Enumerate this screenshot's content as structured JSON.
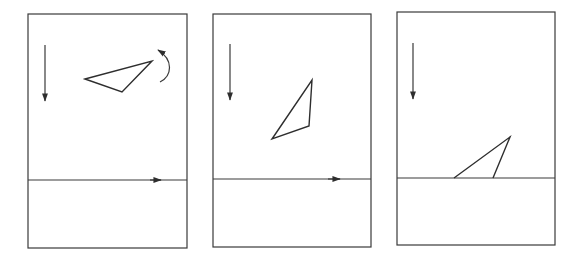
{
  "figure": {
    "colors": {
      "stroke": "#3a3a3a",
      "background": "#ffffff"
    },
    "panels": [
      {
        "id": "panel-1",
        "frame": {
          "x": 28,
          "y": 14,
          "w": 159,
          "h": 234
        },
        "surface_y": 180,
        "gravity_arrow": {
          "x": 45,
          "y1": 45,
          "y2": 100
        },
        "surface_arrow_tip_x": 160,
        "triangle": [
          [
            85,
            79
          ],
          [
            152,
            61
          ],
          [
            122,
            92
          ]
        ],
        "rotation_arrow": true,
        "icons": [
          "gravity-arrow-icon",
          "rotation-arrow-icon",
          "surface-velocity-arrow-icon"
        ]
      },
      {
        "id": "panel-2",
        "frame": {
          "x": 213,
          "y": 14,
          "w": 158,
          "h": 233
        },
        "surface_y": 179,
        "gravity_arrow": {
          "x": 230,
          "y1": 44,
          "y2": 99
        },
        "surface_arrow_tip_x": 340,
        "triangle": [
          [
            312,
            80
          ],
          [
            309,
            126
          ],
          [
            272,
            139
          ]
        ],
        "rotation_arrow": false,
        "icons": [
          "gravity-arrow-icon",
          "surface-velocity-arrow-icon"
        ]
      },
      {
        "id": "panel-3",
        "frame": {
          "x": 397,
          "y": 12,
          "w": 158,
          "h": 233
        },
        "surface_y": 178,
        "gravity_arrow": {
          "x": 413,
          "y1": 43,
          "y2": 98
        },
        "surface_arrow_tip_x": null,
        "triangle": [
          [
            454,
            178
          ],
          [
            510,
            137
          ],
          [
            493,
            178
          ]
        ],
        "rotation_arrow": false,
        "icons": [
          "gravity-arrow-icon"
        ]
      }
    ]
  }
}
